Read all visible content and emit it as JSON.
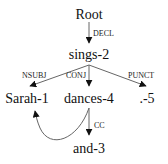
{
  "diagram": {
    "type": "dependency-parse-tree",
    "nodes": [
      {
        "id": "root",
        "label": "Root"
      },
      {
        "id": "sings",
        "label": "sings-2"
      },
      {
        "id": "sarah",
        "label": "Sarah-1"
      },
      {
        "id": "dances",
        "label": "dances-4"
      },
      {
        "id": "period",
        "label": ".-5"
      },
      {
        "id": "and",
        "label": "and-3"
      }
    ],
    "edges": [
      {
        "from": "root",
        "to": "sings",
        "label": "DECL"
      },
      {
        "from": "sings",
        "to": "sarah",
        "label": "NSUBJ"
      },
      {
        "from": "sings",
        "to": "dances",
        "label": "CONJ"
      },
      {
        "from": "sings",
        "to": "period",
        "label": "PUNCT"
      },
      {
        "from": "dances",
        "to": "and",
        "label": "CC"
      },
      {
        "from": "dances",
        "to": "sarah",
        "label": ""
      }
    ]
  }
}
